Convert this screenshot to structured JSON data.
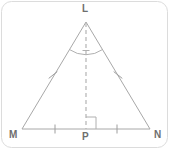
{
  "figure": {
    "canvas": {
      "width": 176,
      "height": 157,
      "background": "#ffffff"
    },
    "frame": {
      "stroke": "#d9d9d9",
      "stroke_width": 1,
      "corner_radius": 10,
      "x": 1,
      "y": 1,
      "width": 167,
      "height": 147
    },
    "style": {
      "line_color": "#a8a8a8",
      "dash_color": "#b4b4b4",
      "label_color": "#6e6e6e",
      "tick_color": "#9e9e9e",
      "line_width": 1,
      "dash_pattern": "4 3"
    },
    "labels": [
      {
        "name": "vertex-label-L",
        "text": "L",
        "x": 85,
        "y": 9
      },
      {
        "name": "vertex-label-M",
        "text": "M",
        "x": 13,
        "y": 135
      },
      {
        "name": "vertex-label-N",
        "text": "N",
        "x": 158,
        "y": 135
      },
      {
        "name": "vertex-label-P",
        "text": "P",
        "x": 86,
        "y": 137
      }
    ],
    "points": {
      "L": {
        "x": 86,
        "y": 22
      },
      "M": {
        "x": 22,
        "y": 129
      },
      "N": {
        "x": 150,
        "y": 129
      },
      "P": {
        "x": 86,
        "y": 129
      }
    },
    "segments": [
      {
        "name": "side-LM",
        "from": "L",
        "to": "M",
        "style": "solid"
      },
      {
        "name": "side-LN",
        "from": "L",
        "to": "N",
        "style": "solid"
      },
      {
        "name": "base-MN",
        "from": "M",
        "to": "N",
        "style": "solid"
      },
      {
        "name": "altitude-LP",
        "from": "L",
        "to": "P",
        "style": "dashed"
      }
    ],
    "congruence_marks": {
      "legs": [
        {
          "name": "tick-mark-side-LM",
          "x": 53,
          "y": 75
        },
        {
          "name": "tick-mark-side-LN",
          "x": 118,
          "y": 75
        }
      ],
      "base_halves": [
        {
          "name": "tick-mark-segment-MP",
          "x": 55,
          "y": 129
        },
        {
          "name": "tick-mark-segment-PN",
          "x": 117,
          "y": 129
        }
      ]
    },
    "angle_arc": {
      "name": "apex-angle-bisector-arc",
      "vertex": "L",
      "radius": 28,
      "has_bisector_tick": true
    },
    "right_angle_marker": {
      "name": "right-angle-marker-at-P",
      "vertex": "P",
      "size": 10,
      "orientation": "upper-right"
    }
  }
}
